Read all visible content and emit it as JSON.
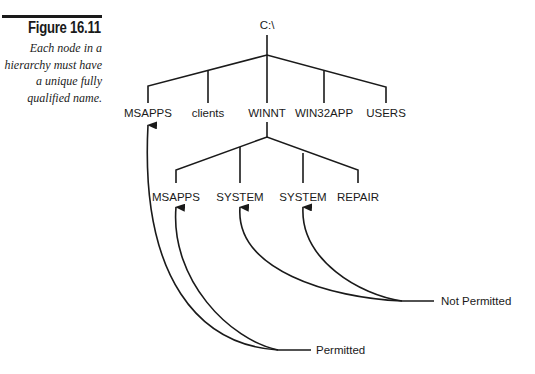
{
  "figure": {
    "title": "Figure 16.11",
    "caption": "Each node in a hierarchy must have a unique fully qualified name."
  },
  "tree": {
    "root": "C:\\",
    "level1": [
      "MSAPPS",
      "clients",
      "WINNT",
      "WIN32APP",
      "USERS"
    ],
    "level2_parent": "WINNT",
    "level2": [
      "MSAPPS",
      "SYSTEM",
      "SYSTEM",
      "REPAIR"
    ]
  },
  "annotations": {
    "permitted": "Permitted",
    "not_permitted": "Not Permitted"
  }
}
